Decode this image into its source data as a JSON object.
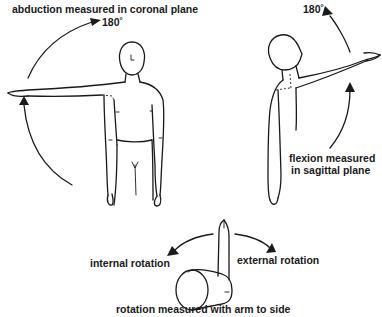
{
  "diagram": {
    "abduction": {
      "label": "abduction measured in coronal plane",
      "angle": "180˚"
    },
    "flexion": {
      "label_line1": "flexion measured",
      "label_line2": "in sagittal plane",
      "angle": "180˚"
    },
    "rotation": {
      "internal_label": "internal rotation",
      "external_label": "external rotation",
      "caption": "rotation measured with arm to side"
    }
  }
}
